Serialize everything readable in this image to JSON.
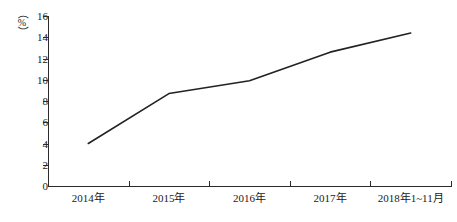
{
  "chart_data": {
    "type": "line",
    "title": "",
    "xlabel": "",
    "ylabel": "(%)",
    "categories": [
      "2014年",
      "2015年",
      "2016年",
      "2017年",
      "2018年1~11月"
    ],
    "values": [
      4.0,
      8.7,
      9.9,
      12.6,
      14.4
    ],
    "series": [
      {
        "name": "",
        "values": [
          4.0,
          8.7,
          9.9,
          12.6,
          14.4
        ]
      }
    ],
    "ylim": [
      0,
      16
    ],
    "ytick_step": 2,
    "ytick_labels": [
      "0",
      "2",
      "4",
      "6",
      "8",
      "10",
      "12",
      "14",
      "16"
    ],
    "grid": false,
    "legend": false,
    "legend_position": "none",
    "line_color": "#222222",
    "axis_color": "#2b2b2b",
    "background_color": "#ffffff",
    "unit_label": {
      "open_paren": "（",
      "symbol": "%",
      "close_paren": "）"
    }
  }
}
